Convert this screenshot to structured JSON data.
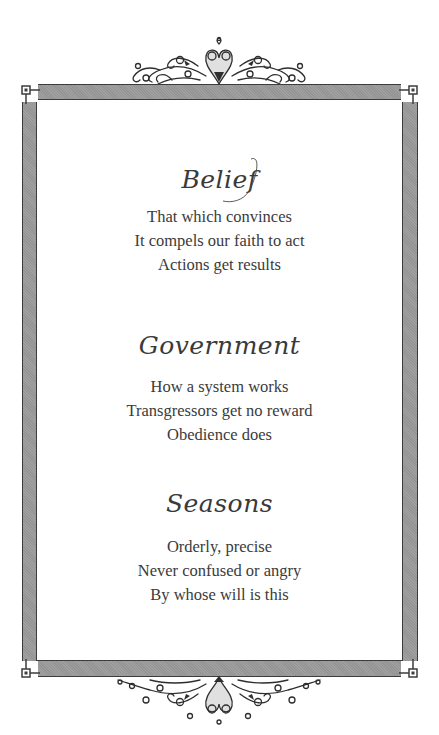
{
  "page": {
    "colors": {
      "background": "#ffffff",
      "frame_fill": "#9a9a9a",
      "frame_outline": "#3c3c3c",
      "text": "#3b3b3b"
    }
  },
  "stanzas": [
    {
      "title": "Belief",
      "lines": [
        "That which convinces",
        "It compels our faith to act",
        "Actions get results"
      ]
    },
    {
      "title": "Government",
      "lines": [
        "How a system works",
        "Transgressors get no reward",
        "Obedience does"
      ]
    },
    {
      "title": "Seasons",
      "lines": [
        "Orderly, precise",
        "Never confused or angry",
        "By whose will is this"
      ]
    }
  ],
  "decorations": {
    "top_ornament": "scroll-flourish-icon",
    "bottom_ornament": "scroll-flourish-icon",
    "frame": "greek-key-corner-frame"
  }
}
